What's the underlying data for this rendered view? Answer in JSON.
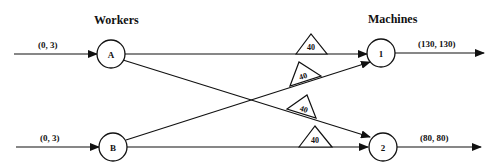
{
  "diagram": {
    "headers": {
      "workers": "Workers",
      "machines": "Machines"
    },
    "workers": [
      {
        "id": "A",
        "label": "A",
        "input_label": "(0, 3)"
      },
      {
        "id": "B",
        "label": "B",
        "input_label": "(0, 3)"
      }
    ],
    "machines": [
      {
        "id": "1",
        "label": "1",
        "output_label": "(130, 130)"
      },
      {
        "id": "2",
        "label": "2",
        "output_label": "(80, 80)"
      }
    ],
    "edges": [
      {
        "from": "A",
        "to": "1",
        "gain_label": "40"
      },
      {
        "from": "B",
        "to": "1",
        "gain_label": "40"
      },
      {
        "from": "A",
        "to": "2",
        "gain_label": "40"
      },
      {
        "from": "B",
        "to": "2",
        "gain_label": "40"
      }
    ],
    "colors": {
      "stroke": "#111111",
      "background": "#ffffff"
    }
  }
}
